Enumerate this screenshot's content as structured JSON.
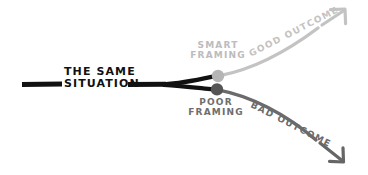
{
  "diagram": {
    "type": "branching-outcome-sketch",
    "canvas": {
      "width": 368,
      "height": 175,
      "background": "#ffffff"
    },
    "trunk": {
      "label_line1": "THE SAME",
      "label_line2": "SITUATION",
      "color": "#111111"
    },
    "branches": [
      {
        "id": "smart",
        "node_label_line1": "SMART",
        "node_label_line2": "FRAMING",
        "outcome_label": "GOOD OUTCOME",
        "color": "#bcbcbc",
        "node_color": "#b5b5b5",
        "direction": "up-right",
        "arrow_icon": "arrow-up-right-icon"
      },
      {
        "id": "poor",
        "node_label_line1": "POOR",
        "node_label_line2": "FRAMING",
        "outcome_label": "BAD OUTCOME",
        "color": "#6b6b6b",
        "node_color": "#555555",
        "direction": "down-right",
        "arrow_icon": "arrow-down-right-icon"
      }
    ]
  }
}
